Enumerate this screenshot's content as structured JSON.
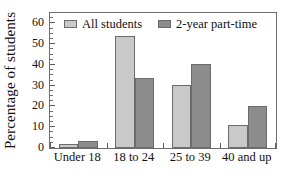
{
  "chart_data": {
    "type": "bar",
    "title": "",
    "xlabel": "",
    "ylabel": "Percentage of students",
    "categories": [
      "Under 18",
      "18 to 24",
      "25 to 39",
      "40 and up"
    ],
    "series": [
      {
        "name": "All students",
        "color": "#c9c9c9",
        "values": [
          2,
          54,
          30.5,
          11
        ]
      },
      {
        "name": "2-year part-time",
        "color": "#8c8c8c",
        "values": [
          3.5,
          33.5,
          40.5,
          20
        ]
      }
    ],
    "ylim": [
      0,
      65
    ],
    "yticks": [
      0,
      10,
      20,
      30,
      40,
      50,
      60
    ],
    "ytick_labels": [
      "0",
      "10",
      "20",
      "30",
      "40",
      "50",
      "60"
    ],
    "y_minor_step": 2.5,
    "grid": false,
    "legend_position": "top-left-inside",
    "frame": true
  },
  "legend": {
    "entries": [
      {
        "label": "All students",
        "swatch_name": "legend-swatch-all-students"
      },
      {
        "label": "2-year part-time",
        "swatch_name": "legend-swatch-two-year-part-time"
      }
    ]
  },
  "colors": {
    "series_light": "#c9c9c9",
    "series_dark": "#8c8c8c",
    "bar_outline": "#6b6b6b",
    "axis": "#6e6e6e",
    "text": "#111111",
    "background": "#ffffff"
  }
}
